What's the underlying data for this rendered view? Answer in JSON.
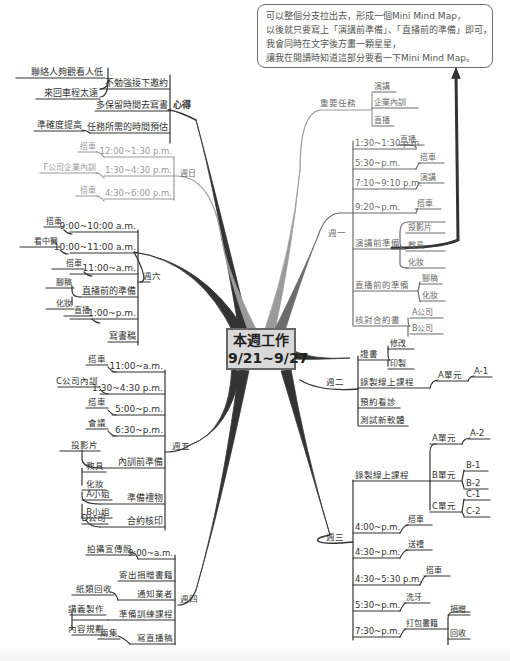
{
  "center": {
    "line1": "本週工作",
    "line2": "9/21~9/27"
  },
  "callout": {
    "lines": [
      "可以整個分支拉出去，形成一個Mini Mind Map，",
      "以後就只要寫上「演講前準備」、「直播前的準備」即可，",
      "我會同時在文字後方畫一顆星星，",
      "讓我在閱讀時知道這部分要看一下Mini Mind Map。"
    ]
  },
  "colors": {
    "dark": "#333333",
    "mid": "#6b6b6b",
    "light": "#9a9a9a",
    "center_fill": "#d9d9d9"
  },
  "branches": {
    "xinde": {
      "label": "心得",
      "items": [
        {
          "label": "不勉強接下邀約",
          "sub": [
            "聯絡人夠觀看人低",
            "來回車程太遠"
          ]
        },
        {
          "label": "多保留時間去寫書",
          "sub": []
        },
        {
          "label": "任務所需的時間預估",
          "sub": [
            "準確度提高"
          ]
        }
      ]
    },
    "sunday": {
      "label": "週日",
      "items": [
        {
          "label": "12:00~1:30 p.m.",
          "sub": [
            "搭車"
          ]
        },
        {
          "label": "1:30~4:30 p.m.",
          "sub": [
            "F公司企業內訓"
          ]
        },
        {
          "label": "4:30~6:00 p.m.",
          "sub": [
            "搭車"
          ]
        }
      ]
    },
    "saturday": {
      "label": "週六",
      "items": [
        {
          "label": "9:00~10:00 a.m.",
          "sub": [
            "搭車"
          ]
        },
        {
          "label": "10:00~11:00 a.m.",
          "sub": [
            "看中醫"
          ]
        },
        {
          "label": "11:00~a.m.",
          "sub": [
            "搭車"
          ]
        },
        {
          "label": "直播前的準備",
          "sub": [
            "腳稿",
            "化妝"
          ]
        },
        {
          "label": "1:00~p.m.",
          "sub": [
            "直播"
          ]
        },
        {
          "label": "寫書稿",
          "sub": []
        }
      ]
    },
    "friday": {
      "label": "週五",
      "items": [
        {
          "label": "11:00~a.m.",
          "sub": [
            "搭車"
          ]
        },
        {
          "label": "1:30~4:30 p.m.",
          "sub": [
            "C公司內訓"
          ]
        },
        {
          "label": "5:00~p.m.",
          "sub": [
            "搭車"
          ]
        },
        {
          "label": "6:30~p.m.",
          "sub": [
            "會議"
          ]
        },
        {
          "label": "內訓前準備",
          "sub": [
            "投影片",
            "教具",
            "化妝"
          ]
        },
        {
          "label": "準備禮物",
          "sub": [
            "A小姐",
            "B小姐"
          ]
        },
        {
          "label": "合約核印",
          "sub": [
            "D公司"
          ]
        }
      ]
    },
    "thursday": {
      "label": "週四",
      "items": [
        {
          "label": "9:00~a.m.",
          "sub": [
            "拍攝宣傳照"
          ]
        },
        {
          "label": "寄出捐贈書籍",
          "sub": []
        },
        {
          "label": "通知業者",
          "sub": [
            "紙類回收"
          ]
        },
        {
          "label": "準備訓練課程",
          "sub": [
            "講義製作",
            "內容規劃"
          ]
        },
        {
          "label": "寫直播稿",
          "sub": [
            "兩集"
          ]
        }
      ]
    },
    "important": {
      "label": "重要任務",
      "items": [
        "演講",
        "企業內訓",
        "直播"
      ]
    },
    "monday": {
      "label": "週一",
      "items": [
        {
          "label": "1:30~1:30 p.m.",
          "sub": [
            "直播"
          ]
        },
        {
          "label": "5:30~p.m.",
          "sub": [
            "搭車"
          ]
        },
        {
          "label": "7:10~9:10 p.m.",
          "sub": [
            "演講"
          ]
        },
        {
          "label": "9:20~p.m.",
          "sub": [
            "搭車"
          ]
        },
        {
          "label": "演講前準備",
          "sub": [
            "投影片",
            "教具",
            "化妝"
          ]
        },
        {
          "label": "直播前的準備",
          "sub": [
            "腳稿",
            "化妝"
          ]
        },
        {
          "label": "核對合約書",
          "sub": [
            "A公司",
            "B公司"
          ]
        }
      ]
    },
    "tuesday": {
      "label": "週二",
      "items": [
        {
          "label": "證書",
          "sub": [
            "修改",
            "印製"
          ]
        },
        {
          "label": "錄製線上課程",
          "sub": [
            "A單元",
            "A-1"
          ]
        },
        {
          "label": "預約看診",
          "sub": []
        },
        {
          "label": "測試新軟體",
          "sub": []
        }
      ]
    },
    "wednesday": {
      "label": "週三",
      "items": [
        {
          "label": "錄製線上課程",
          "units": [
            {
              "label": "A單元",
              "sub": [
                "A-2"
              ]
            },
            {
              "label": "B單元",
              "sub": [
                "B-1",
                "B-2"
              ]
            },
            {
              "label": "C單元",
              "sub": [
                "C-1",
                "C-2"
              ]
            }
          ]
        },
        {
          "label": "4:00~p.m.",
          "sub": [
            "搭車"
          ]
        },
        {
          "label": "4:30~p.m.",
          "sub": [
            "送禮"
          ]
        },
        {
          "label": "4:30~5:30 p.m.",
          "sub": [
            "搭車"
          ]
        },
        {
          "label": "5:30~p.m.",
          "sub": [
            "洗牙"
          ]
        },
        {
          "label": "7:30~p.m.",
          "sub": [
            "打包書籍"
          ],
          "subsub": [
            "捐贈",
            "回收"
          ]
        }
      ]
    }
  }
}
